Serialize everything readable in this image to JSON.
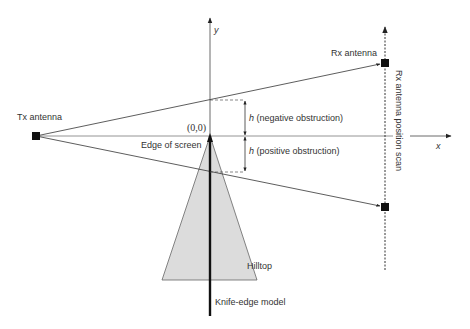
{
  "diagram": {
    "labels": {
      "tx_antenna": "Tx antenna",
      "rx_antenna": "Rx antenna",
      "rx_scan": "Rx antenna position scan",
      "origin": "(0,0)",
      "edge_of_screen": "Edge of screen",
      "h_symbol_neg": "h",
      "h_negative": " (negative obstruction)",
      "h_symbol_pos": "h",
      "h_positive": " (positive obstruction)",
      "hilltop": "Hilltop",
      "knife_edge": "Knife-edge model",
      "x_axis": "x",
      "y_axis": "y"
    },
    "colors": {
      "line": "#333333",
      "hill_fill": "#dcdcdc",
      "hill_stroke": "#666666",
      "marker": "#111111",
      "axis_gray": "#888888"
    }
  }
}
